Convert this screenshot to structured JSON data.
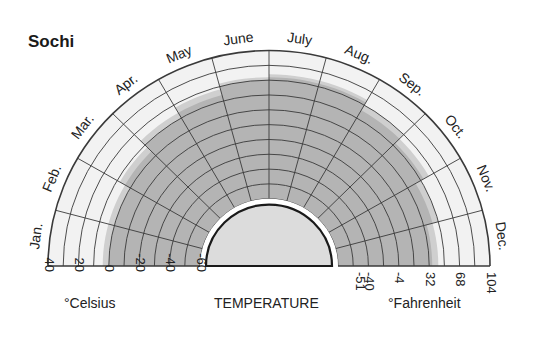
{
  "title": "Sochi",
  "chart_data": {
    "type": "polar-area",
    "title": "Sochi",
    "xlabel": "TEMPERATURE",
    "months": [
      "Jan.",
      "Feb.",
      "Mar.",
      "Apr.",
      "May",
      "June",
      "July",
      "Aug.",
      "Sep.",
      "Oct.",
      "Nov.",
      "Dec."
    ],
    "series": [
      {
        "name": "mean temperature range (dark band) upper edge °C",
        "values": [
          0,
          0,
          4,
          10,
          14,
          20,
          22,
          22,
          16,
          12,
          6,
          2
        ]
      },
      {
        "name": "extreme/upper light band edge °C",
        "values": [
          4,
          4,
          8,
          14,
          18,
          22,
          24,
          24,
          20,
          16,
          10,
          6
        ]
      }
    ],
    "radial_axis": {
      "min": -60,
      "max": 40,
      "ring_step": 10,
      "unit": "°C"
    },
    "celsius_ticks": [
      "40",
      "20",
      "0",
      "-20",
      "-40",
      "-60"
    ],
    "fahrenheit_ticks": [
      "-51",
      "-40",
      "-4",
      "32",
      "68",
      "104"
    ],
    "celsius_label": "°Celsius",
    "fahrenheit_label": "°Fahrenheit"
  },
  "colors": {
    "dark_band": "#b4b4b4",
    "light_band": "#cfcfcf",
    "background_cell": "#f2f2f2",
    "inner_disc": "#dcdcdc",
    "lines": "#3a3a3a"
  }
}
